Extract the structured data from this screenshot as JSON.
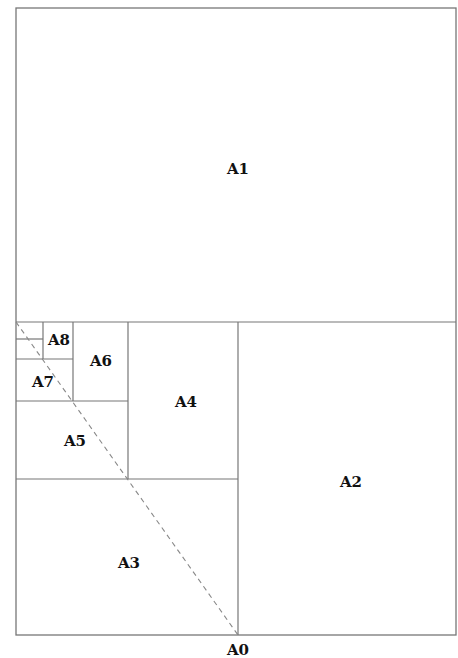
{
  "diagram": {
    "colors": {
      "line": "#777777",
      "label": "#111111",
      "background": "#ffffff"
    },
    "frame": {
      "x": 16,
      "y": 8,
      "width": 440,
      "height": 627
    },
    "sheets": [
      {
        "id": "A1",
        "label": "A1",
        "x": 16,
        "y": 8,
        "w": 440,
        "h": 314,
        "lx": 238,
        "ly": 170
      },
      {
        "id": "A2",
        "label": "A2",
        "x": 238,
        "y": 322,
        "w": 218,
        "h": 313,
        "lx": 351,
        "ly": 483
      },
      {
        "id": "A3",
        "label": "A3",
        "x": 16,
        "y": 479,
        "w": 222,
        "h": 156,
        "lx": 129,
        "ly": 564
      },
      {
        "id": "A4",
        "label": "A4",
        "x": 128,
        "y": 322,
        "w": 110,
        "h": 157,
        "lx": 186,
        "ly": 403
      },
      {
        "id": "A5",
        "label": "A5",
        "x": 16,
        "y": 401,
        "w": 112,
        "h": 78,
        "lx": 75,
        "ly": 442
      },
      {
        "id": "A6",
        "label": "A6",
        "x": 73,
        "y": 322,
        "w": 55,
        "h": 79,
        "lx": 101,
        "ly": 362
      },
      {
        "id": "A7",
        "label": "A7",
        "x": 16,
        "y": 359,
        "w": 57,
        "h": 42,
        "lx": 43,
        "ly": 383
      },
      {
        "id": "A8",
        "label": "A8",
        "x": 43,
        "y": 322,
        "w": 30,
        "h": 37,
        "lx": 59,
        "ly": 341
      },
      {
        "id": "A9",
        "label": "",
        "x": 16,
        "y": 339,
        "w": 27,
        "h": 20
      },
      {
        "id": "A10",
        "label": "",
        "x": 16,
        "y": 322,
        "w": 27,
        "h": 17
      }
    ],
    "diagonal": {
      "x1": 16,
      "y1": 322,
      "x2": 238,
      "y2": 635,
      "style": "dashed"
    },
    "base_label": {
      "text": "A0",
      "x": 238,
      "y": 657
    }
  }
}
